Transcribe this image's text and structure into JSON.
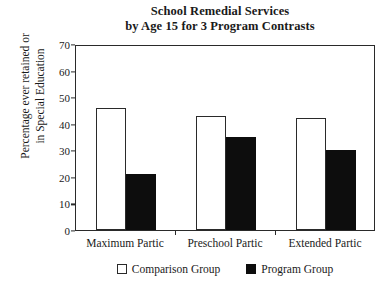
{
  "chart_data": {
    "type": "bar",
    "title": "School Remedial Services by Age 15 for 3 Program Contrasts",
    "title_line1": "School Remedial Services",
    "title_line2": "by Age 15 for 3 Program Contrasts",
    "xlabel": "",
    "ylabel": "Percentage ever retained or in Special Education",
    "ylabel_line1": "Percentage ever retained or",
    "ylabel_line2": "in Special Education",
    "categories": [
      "Maximum Partic",
      "Preschool Partic",
      "Extended Partic"
    ],
    "yticks": [
      0,
      10,
      20,
      30,
      40,
      50,
      60,
      70
    ],
    "ylim": [
      0,
      70
    ],
    "grid": false,
    "legend_position": "bottom-center",
    "series": [
      {
        "name": "Comparison Group",
        "color": "#ffffff",
        "edge_color": "#2a2a2a",
        "values": [
          46,
          43,
          42
        ]
      },
      {
        "name": "Program Group",
        "color": "#0d0d0d",
        "edge_color": "#0d0d0d",
        "values": [
          21,
          35,
          30
        ]
      }
    ]
  }
}
